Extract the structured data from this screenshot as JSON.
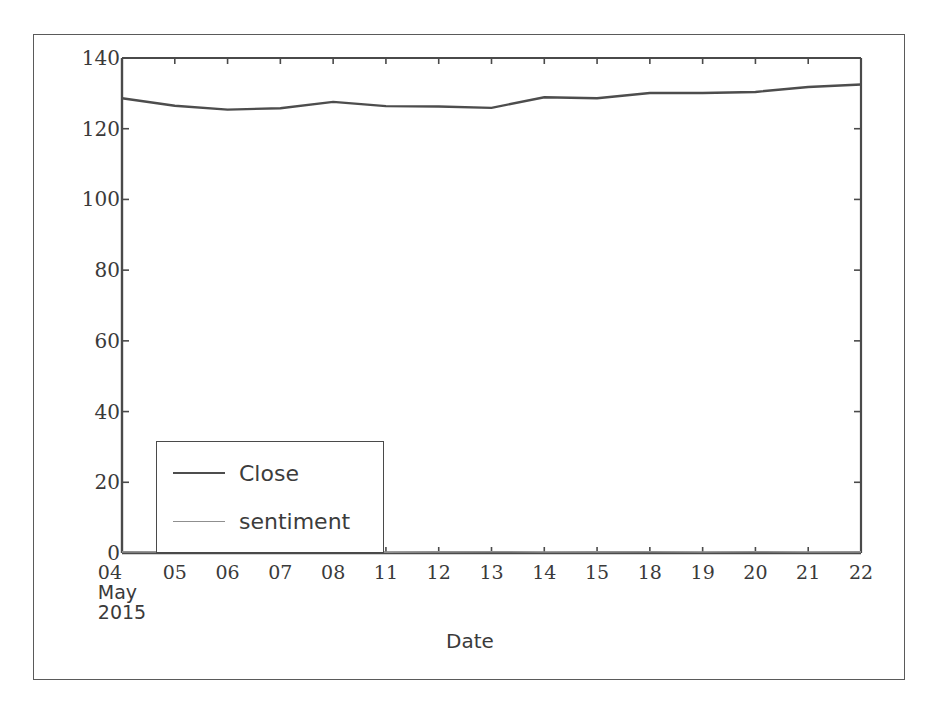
{
  "chart_data": {
    "type": "line",
    "title": "",
    "xlabel": "Date",
    "ylabel": "",
    "xlim_labels": [
      "04",
      "22"
    ],
    "ylim": [
      0,
      140
    ],
    "yticks": [
      0,
      20,
      40,
      60,
      80,
      100,
      120,
      140
    ],
    "ytick_labels": [
      "0",
      "20",
      "40",
      "60",
      "80",
      "100",
      "120",
      "140"
    ],
    "grid": false,
    "legend_position": "lower left",
    "x_axis_period": "May 2015",
    "categories": [
      "04",
      "05",
      "06",
      "07",
      "08",
      "11",
      "12",
      "13",
      "14",
      "15",
      "18",
      "19",
      "20",
      "21",
      "22"
    ],
    "xtick_labels": [
      "04",
      "05",
      "06",
      "07",
      "08",
      "11",
      "12",
      "13",
      "14",
      "15",
      "18",
      "19",
      "20",
      "21",
      "22"
    ],
    "xtick_sublabel_lines": [
      "May",
      "2015"
    ],
    "series": [
      {
        "name": "Close",
        "color": "#4d4d4d",
        "linewidth": 2.4,
        "values": [
          128.6,
          126.5,
          125.4,
          125.8,
          127.6,
          126.4,
          126.3,
          125.9,
          128.9,
          128.6,
          130.1,
          130.1,
          130.4,
          131.8,
          132.5
        ]
      },
      {
        "name": "sentiment",
        "color": "#8f8f8f",
        "linewidth": 1.6,
        "values": [
          0.32,
          0.28,
          0.35,
          0.3,
          0.41,
          0.26,
          0.33,
          0.37,
          0.29,
          0.31,
          0.34,
          0.27,
          0.36,
          0.3,
          0.33
        ]
      }
    ]
  },
  "legend": {
    "entries": [
      {
        "label": "Close"
      },
      {
        "label": "sentiment"
      }
    ]
  },
  "axis": {
    "x_title": "Date"
  },
  "colors": {
    "close_line": "#4d4d4d",
    "sentiment_line": "#8f8f8f",
    "spine": "#4a4a4a",
    "text": "#3a3a3a",
    "figure_border": "#5a5a5a",
    "background": "#ffffff"
  }
}
